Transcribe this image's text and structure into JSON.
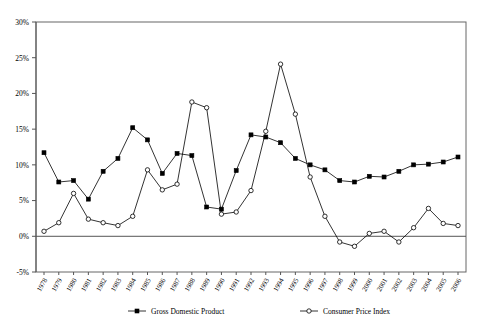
{
  "chart_data": {
    "type": "line",
    "title": "",
    "xlabel": "",
    "ylabel": "",
    "ylim": [
      -5,
      30
    ],
    "ytick_step": 5,
    "ytick_labels": [
      "30%",
      "25%",
      "20%",
      "15%",
      "10%",
      "5%",
      "0%",
      "-5%"
    ],
    "ytick_values": [
      30,
      25,
      20,
      15,
      10,
      5,
      0,
      -5
    ],
    "grid": false,
    "legend_position": "bottom",
    "categories": [
      "1978",
      "1979",
      "1980",
      "1981",
      "1982",
      "1983",
      "1984",
      "1985",
      "1986",
      "1987",
      "1988",
      "1989",
      "1990",
      "1991",
      "1992",
      "1993",
      "1994",
      "1995",
      "1996",
      "1997",
      "1998",
      "1999",
      "2000",
      "2001",
      "2002",
      "2003",
      "2004",
      "2005",
      "2006"
    ],
    "x": [
      1978,
      1979,
      1980,
      1981,
      1982,
      1983,
      1984,
      1985,
      1986,
      1987,
      1988,
      1989,
      1990,
      1991,
      1992,
      1993,
      1994,
      1995,
      1996,
      1997,
      1998,
      1999,
      2000,
      2001,
      2002,
      2003,
      2004,
      2005,
      2006
    ],
    "series": [
      {
        "name": "Gross Domestic Product",
        "marker": "filled-square",
        "values": [
          11.7,
          7.6,
          7.8,
          5.2,
          9.1,
          10.9,
          15.2,
          13.5,
          8.8,
          11.6,
          11.3,
          4.1,
          3.8,
          9.2,
          14.2,
          13.9,
          13.1,
          10.9,
          10.0,
          9.3,
          7.8,
          7.6,
          8.4,
          8.3,
          9.1,
          10.0,
          10.1,
          10.4,
          11.1
        ]
      },
      {
        "name": "Consumer Price Index",
        "marker": "open-circle",
        "values": [
          0.7,
          1.9,
          6.0,
          2.4,
          1.9,
          1.5,
          2.8,
          9.3,
          6.5,
          7.3,
          18.8,
          18.0,
          3.1,
          3.4,
          6.4,
          14.7,
          24.1,
          17.1,
          8.3,
          2.8,
          -0.8,
          -1.4,
          0.4,
          0.7,
          -0.8,
          1.2,
          3.9,
          1.8,
          1.5
        ]
      }
    ],
    "legend": [
      {
        "label": "Gross Domestic Product",
        "marker": "filled-square"
      },
      {
        "label": "Consumer Price Index",
        "marker": "open-circle"
      }
    ]
  },
  "colors": {
    "line": "#000000",
    "axis": "#555555",
    "frame": "#666666",
    "background": "#ffffff"
  }
}
